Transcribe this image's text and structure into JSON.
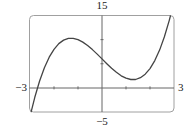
{
  "chart_data": {
    "type": "line",
    "title": "",
    "xlabel": "",
    "ylabel": "",
    "xlim": [
      -3,
      3
    ],
    "ylim": [
      -5,
      15
    ],
    "grid": false,
    "legend": null,
    "axis_labels": {
      "x_min": "−3",
      "x_max": "3",
      "y_min": "−5",
      "y_max": "15"
    },
    "x_ticks": [
      -2,
      -1,
      1,
      2
    ],
    "y_ticks": [
      5,
      10
    ],
    "function_estimate": "x^3 - 5x + 6",
    "series": [
      {
        "name": "f(x)",
        "x": [
          -2.95,
          -2.8,
          -2.6,
          -2.4,
          -2.2,
          -2.0,
          -1.8,
          -1.6,
          -1.4,
          -1.2,
          -1.0,
          -0.8,
          -0.6,
          -0.4,
          -0.2,
          0.0,
          0.2,
          0.4,
          0.6,
          0.8,
          1.0,
          1.2,
          1.4,
          1.6,
          1.8,
          2.0,
          2.2,
          2.4,
          2.6,
          2.8,
          2.85
        ],
        "y": [
          -4.92,
          -1.95,
          1.42,
          4.18,
          6.35,
          8.0,
          9.17,
          9.9,
          10.26,
          10.27,
          10.0,
          9.49,
          8.78,
          7.94,
          6.99,
          6.0,
          5.01,
          4.06,
          3.22,
          2.51,
          2.0,
          1.73,
          1.74,
          2.1,
          2.83,
          4.0,
          5.65,
          7.82,
          10.58,
          13.95,
          14.9
        ]
      }
    ],
    "annotations": {
      "local_max": {
        "x": -1.29,
        "y": 10.3
      },
      "local_min": {
        "x": 1.29,
        "y": 1.7
      },
      "y_intercept": 6
    }
  },
  "colors": {
    "frame": "#9a9a9a",
    "axes": "#555555",
    "curve": "#444444",
    "text": "#222222"
  }
}
